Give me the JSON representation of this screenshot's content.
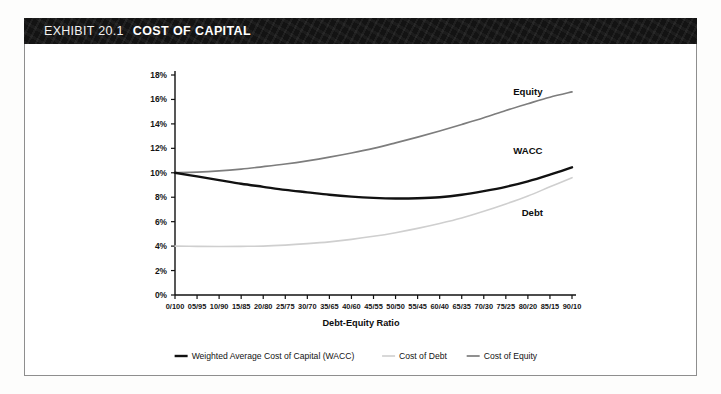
{
  "exhibit": {
    "number_label": "EXHIBIT 20.1",
    "heading": "COST OF CAPITAL"
  },
  "chart_data": {
    "type": "line",
    "title": "COST OF CAPITAL",
    "xlabel": "Debt-Equity Ratio",
    "ylabel": "",
    "grid": false,
    "legend_position": "bottom",
    "ylim": [
      0,
      18
    ],
    "y_tick_labels": [
      "0%",
      "2%",
      "4%",
      "6%",
      "8%",
      "10%",
      "12%",
      "14%",
      "16%",
      "18%"
    ],
    "y_tick_values": [
      0,
      2,
      4,
      6,
      8,
      10,
      12,
      14,
      16,
      18
    ],
    "categories": [
      "0/100",
      "05/95",
      "10/90",
      "15/85",
      "20/80",
      "25/75",
      "30/70",
      "35/65",
      "40/60",
      "45/55",
      "50/50",
      "55/45",
      "60/40",
      "65/35",
      "70/30",
      "75/25",
      "80/20",
      "85/15",
      "90/10"
    ],
    "series": [
      {
        "name": "Weighted Average Cost of Capital (WACC)",
        "short_name": "WACC",
        "color": "#111111",
        "width": 2.4,
        "values": [
          10.0,
          9.7,
          9.4,
          9.1,
          8.85,
          8.6,
          8.4,
          8.2,
          8.05,
          7.95,
          7.9,
          7.92,
          8.0,
          8.2,
          8.5,
          8.85,
          9.3,
          9.85,
          10.45
        ]
      },
      {
        "name": "Cost of Debt",
        "short_name": "Debt",
        "color": "#cfcfcf",
        "width": 1.6,
        "values": [
          4.0,
          3.98,
          3.97,
          3.98,
          4.0,
          4.08,
          4.2,
          4.35,
          4.55,
          4.8,
          5.1,
          5.45,
          5.85,
          6.3,
          6.85,
          7.45,
          8.1,
          8.85,
          9.6
        ]
      },
      {
        "name": "Cost of Equity",
        "short_name": "Equity",
        "color": "#7d7d7d",
        "width": 1.7,
        "values": [
          10.0,
          10.05,
          10.15,
          10.3,
          10.5,
          10.72,
          10.98,
          11.28,
          11.62,
          12.0,
          12.45,
          12.92,
          13.42,
          13.95,
          14.5,
          15.1,
          15.65,
          16.18,
          16.62
        ]
      }
    ],
    "series_tags": [
      {
        "label": "Equity",
        "x_index": 16.0,
        "y_value": 16.4
      },
      {
        "label": "WACC",
        "x_index": 16.0,
        "y_value": 11.5
      },
      {
        "label": "Debt",
        "x_index": 16.2,
        "y_value": 6.5
      }
    ],
    "legend": [
      {
        "label": "Weighted Average Cost of Capital (WACC)",
        "color": "#111111",
        "width": 2.4
      },
      {
        "label": "Cost of Debt",
        "color": "#cfcfcf",
        "width": 1.6
      },
      {
        "label": "Cost of Equity",
        "color": "#7d7d7d",
        "width": 1.7
      }
    ],
    "colors": {
      "axis": "#111111",
      "wacc": "#111111",
      "debt": "#cfcfcf",
      "equity": "#7d7d7d",
      "frame": "#8e8e8e",
      "title_bar": "#131313"
    }
  }
}
